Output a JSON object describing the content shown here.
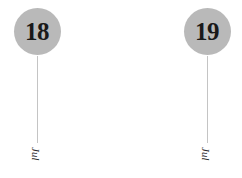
{
  "chart_data": {
    "type": "timeline",
    "title": "",
    "xlabel": "",
    "ylabel": "",
    "grid": false,
    "legend": null,
    "background_color": "#ffffff",
    "bubble_color": "#b9b9b9",
    "stem_color": "#c4c4c4",
    "text_color": "#191919",
    "categories": [
      "Jul 18",
      "Jul 19"
    ],
    "events": [
      {
        "day": "18",
        "month": "Jul",
        "x": 37,
        "bubble_top": 8,
        "stem_top": 56,
        "stem_bottom": 143,
        "label_y": 147
      },
      {
        "day": "19",
        "month": "Jul",
        "x": 207,
        "bubble_top": 8,
        "stem_top": 56,
        "stem_bottom": 143,
        "label_y": 147
      }
    ]
  },
  "canvas": {
    "width": "242",
    "height": "178"
  }
}
